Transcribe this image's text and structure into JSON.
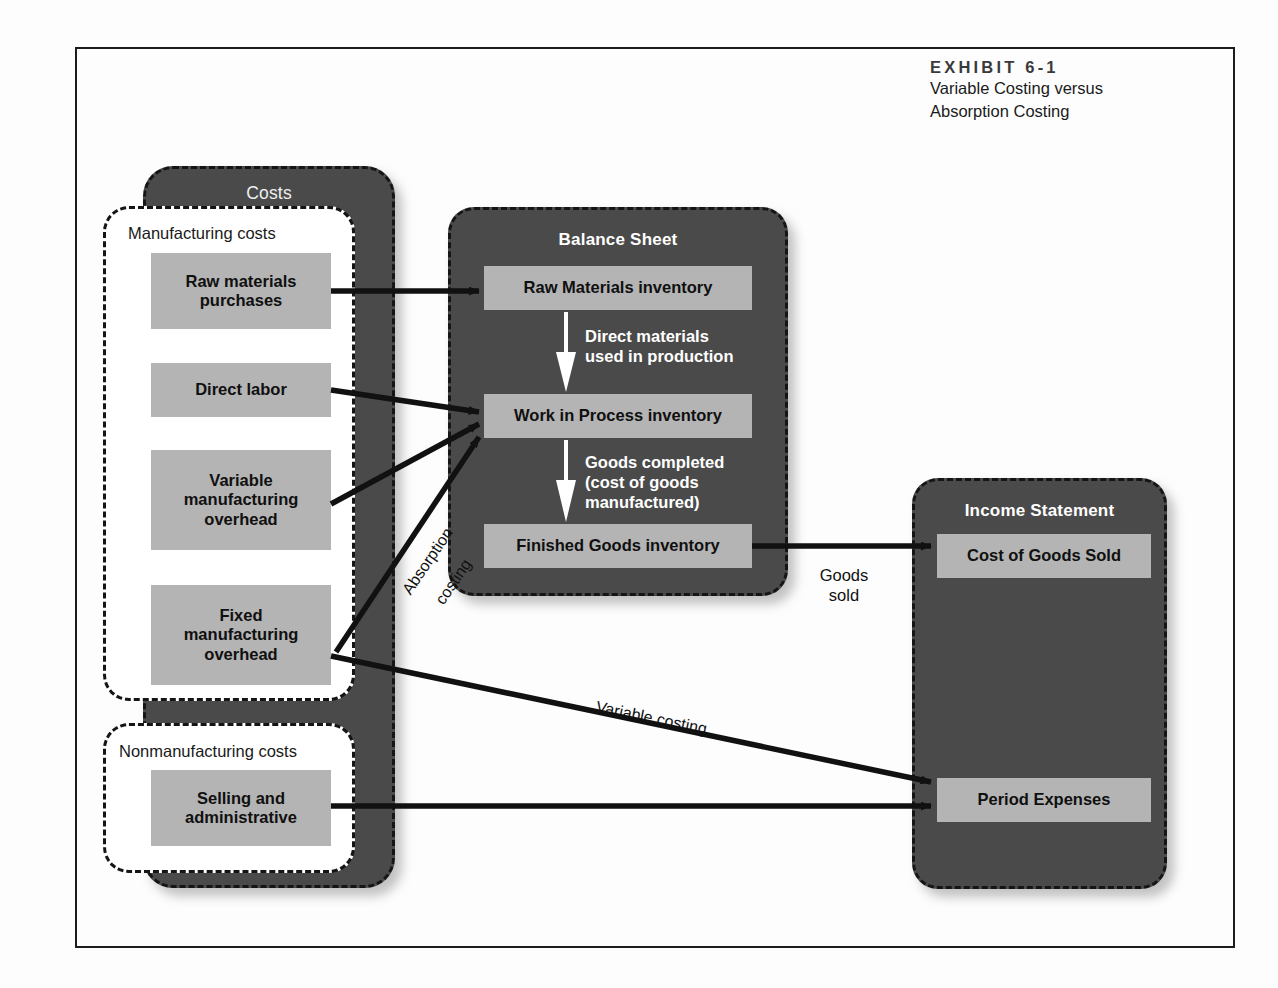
{
  "caption": {
    "eyebrow": "EXHIBIT 6-1",
    "line1": "Variable Costing versus",
    "line2": "Absorption Costing"
  },
  "costs_panel": {
    "title": "Costs",
    "manufacturing": {
      "label": "Manufacturing costs",
      "items": [
        {
          "label": "Raw materials\npurchases"
        },
        {
          "label": "Direct labor"
        },
        {
          "label": "Variable\nmanufacturing\noverhead"
        },
        {
          "label": "Fixed\nmanufacturing\noverhead"
        }
      ]
    },
    "nonmanufacturing": {
      "label": "Nonmanufacturing costs",
      "items": [
        {
          "label": "Selling and\nadministrative"
        }
      ]
    }
  },
  "balance_sheet": {
    "title": "Balance Sheet",
    "items": [
      {
        "label": "Raw Materials inventory"
      },
      {
        "label": "Work in Process inventory"
      },
      {
        "label": "Finished Goods inventory"
      }
    ],
    "flows": [
      {
        "label": "Direct materials\nused in production"
      },
      {
        "label": "Goods completed\n(cost of goods\nmanufactured)"
      }
    ]
  },
  "income_statement": {
    "title": "Income Statement",
    "items": [
      {
        "label": "Cost of Goods Sold"
      },
      {
        "label": "Period Expenses"
      }
    ]
  },
  "edge_labels": {
    "absorption_line1": "Absorption",
    "absorption_line2": "costing",
    "variable_costing": "Variable costing",
    "goods_sold": "Goods\nsold"
  },
  "colors": {
    "panel_dark": "#4a4a4a",
    "item_gray": "#b4b4b4",
    "frame": "#1c1c1c",
    "arrow_dark": "#111111",
    "arrow_light": "#ffffff"
  }
}
